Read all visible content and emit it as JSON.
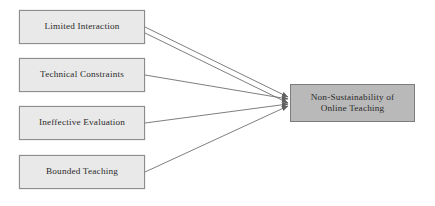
{
  "diagram": {
    "canvas": {
      "width": 435,
      "height": 206,
      "background": "#ffffff"
    },
    "colors": {
      "source_fill": "#e9e9e9",
      "source_border": "#8d8d8d",
      "target_fill": "#b9b9b9",
      "target_border": "#7d7d7d",
      "arrow": "#6f6f6f",
      "text": "#2b2b2b"
    },
    "sources": [
      {
        "id": "limited-interaction",
        "label": "Limited Interaction",
        "x": 19,
        "y": 10,
        "width": 126,
        "height": 34
      },
      {
        "id": "technical-constraints",
        "label": "Technical Constraints",
        "x": 19,
        "y": 58,
        "width": 126,
        "height": 34
      },
      {
        "id": "ineffective-evaluation",
        "label": "Ineffective Evaluation",
        "x": 19,
        "y": 106,
        "width": 126,
        "height": 34
      },
      {
        "id": "bounded-teaching",
        "label": "Bounded Teaching",
        "x": 19,
        "y": 155,
        "width": 126,
        "height": 34
      }
    ],
    "target": {
      "id": "non-sustainability-of-online-teaching",
      "label": "Non-Sustainability of\nOnline Teaching",
      "line1": "Non-Sustainability of",
      "line2": "Online Teaching",
      "x": 290,
      "y": 84,
      "width": 125,
      "height": 38
    },
    "edges": [
      {
        "id": "edge-limited-interaction",
        "from": "limited-interaction",
        "to": "non-sustainability-of-online-teaching",
        "x1": 145,
        "y1": 27,
        "x2": 288,
        "y2": 97
      },
      {
        "id": "edge-technical-constraints",
        "from": "technical-constraints",
        "to": "non-sustainability-of-online-teaching",
        "x1": 145,
        "y1": 75,
        "x2": 288,
        "y2": 99
      },
      {
        "id": "edge-ineffective-evaluation",
        "from": "ineffective-evaluation",
        "to": "non-sustainability-of-online-teaching",
        "x1": 145,
        "y1": 123,
        "x2": 288,
        "y2": 104
      },
      {
        "id": "edge-bounded-teaching",
        "from": "bounded-teaching",
        "to": "non-sustainability-of-online-teaching",
        "x1": 145,
        "y1": 172,
        "x2": 288,
        "y2": 106
      },
      {
        "id": "edge-limited-interaction-secondary",
        "from": "limited-interaction",
        "to": "non-sustainability-of-online-teaching",
        "x1": 145,
        "y1": 33,
        "x2": 288,
        "y2": 103
      }
    ]
  }
}
